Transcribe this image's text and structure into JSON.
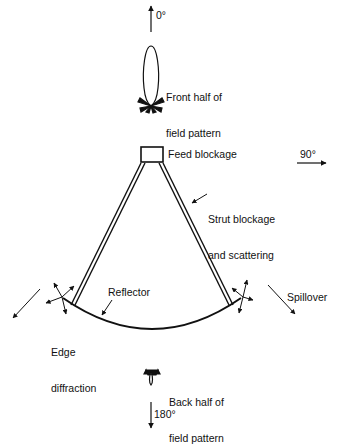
{
  "diagram": {
    "labels": {
      "front_angle": "0°",
      "front_pattern_line1": "Front half of",
      "front_pattern_line2": "field pattern",
      "feed_blockage": "Feed blockage",
      "side_angle": "90°",
      "strut_line1": "Strut blockage",
      "strut_line2": "and scattering",
      "reflector": "Reflector",
      "edge_line1": "Edge",
      "edge_line2": "diffraction",
      "spillover": "Spillover",
      "back_pattern_line1": "Back half of",
      "back_pattern_line2": "field pattern",
      "back_angle": "180°"
    },
    "colors": {
      "ink": "#111111",
      "background": "#ffffff"
    }
  }
}
